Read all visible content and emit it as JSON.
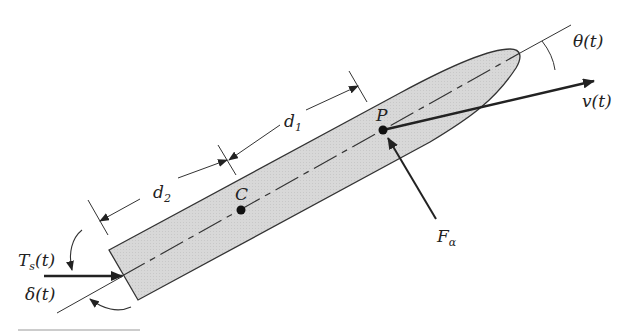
{
  "diagram": {
    "type": "free-body diagram of an elongated body (torpedo/vessel) with thrust, velocity and force vectors",
    "colors": {
      "body_fill": "#d6d6d6",
      "stroke": "#222222",
      "background": "#ffffff",
      "bottom_rule": "#bbbbbb"
    },
    "labels": {
      "theta": "θ(t)",
      "velocity": "v(t)",
      "d1": "d",
      "d1_sub": "1",
      "d2": "d",
      "d2_sub": "2",
      "point_p": "P",
      "point_c": "C",
      "force": "F",
      "force_sub": "α",
      "thrust": "T",
      "thrust_sub": "s",
      "thrust_arg": "(t)",
      "delta": "δ(t)"
    },
    "points": {
      "C": {
        "x": 241,
        "y": 210
      },
      "P": {
        "x": 383,
        "y": 130
      },
      "nose_tip": {
        "x": 520,
        "y": 53
      },
      "stern_mid": {
        "x": 122,
        "y": 276
      }
    }
  }
}
